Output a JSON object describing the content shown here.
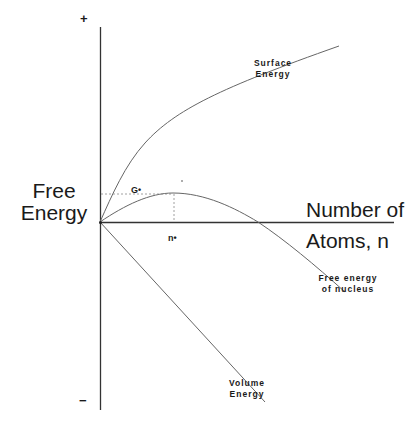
{
  "diagram": {
    "y_axis": {
      "label_line1": "Free",
      "label_line2": "Energy",
      "plus_label": "+",
      "minus_label": "−"
    },
    "x_axis": {
      "label_line1": "Number of",
      "label_line2": "Atoms, n"
    },
    "markers": {
      "critical_energy": "G•",
      "critical_size": "n•"
    },
    "curves": [
      {
        "name": "Surface Energy",
        "label_line1": "Surface",
        "label_line2": "Energy",
        "shape": "increasing, concave down (∝ n^2/3)"
      },
      {
        "name": "Free energy of nucleus",
        "label_line1": "Free energy",
        "label_line2": "of nucleus",
        "shape": "rises to maximum G* at n*, then decreases"
      },
      {
        "name": "Volume Energy",
        "label_line1": "Volume",
        "label_line2": "Energy",
        "shape": "linearly decreasing (∝ −n)"
      }
    ],
    "colors": {
      "line": "#555555",
      "axis": "#333333",
      "text": "#1a1a1a"
    }
  }
}
